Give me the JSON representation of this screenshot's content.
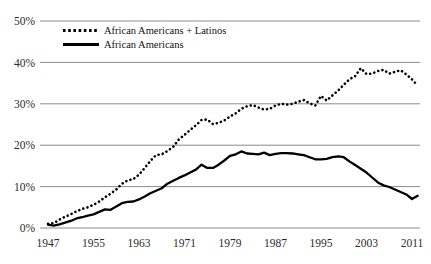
{
  "chart_data": {
    "type": "line",
    "title": "",
    "xlabel": "",
    "ylabel": "",
    "xlim": [
      1947,
      2012
    ],
    "ylim": [
      0,
      50
    ],
    "grid": true,
    "grid_axis": "y",
    "legend_position": "top-left-inside",
    "x_ticks": [
      "1947",
      "1955",
      "1963",
      "1971",
      "1979",
      "1987",
      "1995",
      "2003",
      "2011"
    ],
    "y_ticks": [
      "0%",
      "10%",
      "20%",
      "30%",
      "40%",
      "50%"
    ],
    "y_tick_values": [
      0,
      10,
      20,
      30,
      40,
      50
    ],
    "x_tick_values": [
      1947,
      1955,
      1963,
      1971,
      1979,
      1987,
      1995,
      2003,
      2011
    ],
    "x": [
      1947,
      1948,
      1949,
      1950,
      1951,
      1952,
      1953,
      1954,
      1955,
      1956,
      1957,
      1958,
      1959,
      1960,
      1961,
      1962,
      1963,
      1964,
      1965,
      1966,
      1967,
      1968,
      1969,
      1970,
      1971,
      1972,
      1973,
      1974,
      1975,
      1976,
      1977,
      1978,
      1979,
      1980,
      1981,
      1982,
      1983,
      1984,
      1985,
      1986,
      1987,
      1988,
      1989,
      1990,
      1991,
      1992,
      1993,
      1994,
      1995,
      1996,
      1997,
      1998,
      1999,
      2000,
      2001,
      2002,
      2003,
      2004,
      2005,
      2006,
      2007,
      2008,
      2009,
      2010,
      2011,
      2012
    ],
    "series": [
      {
        "name": "African Americans + Latinos",
        "style": "dotted",
        "color": "#000000",
        "values": [
          1.0,
          1.2,
          2.0,
          2.7,
          3.3,
          4.0,
          4.6,
          5.0,
          5.6,
          6.4,
          7.4,
          8.3,
          9.3,
          10.7,
          11.5,
          11.8,
          12.9,
          14.5,
          16.2,
          17.6,
          17.8,
          18.6,
          19.6,
          21.4,
          22.5,
          23.7,
          24.8,
          26.1,
          26.2,
          25.1,
          25.4,
          26.0,
          26.9,
          27.7,
          28.8,
          29.4,
          29.7,
          29.1,
          28.6,
          28.8,
          29.6,
          30.0,
          29.8,
          30.0,
          30.5,
          30.9,
          30.1,
          29.6,
          31.9,
          30.8,
          32.0,
          33.2,
          34.6,
          35.9,
          36.7,
          38.6,
          37.2,
          37.3,
          37.9,
          38.2,
          37.3,
          37.7,
          38.1,
          37.1,
          35.9,
          34.4
        ]
      },
      {
        "name": "African Americans",
        "style": "solid",
        "color": "#000000",
        "values": [
          0.8,
          0.6,
          0.9,
          1.3,
          1.7,
          2.3,
          2.6,
          3.0,
          3.3,
          3.9,
          4.5,
          4.4,
          5.2,
          6.0,
          6.3,
          6.4,
          6.9,
          7.6,
          8.4,
          9.0,
          9.6,
          10.7,
          11.4,
          12.1,
          12.7,
          13.4,
          14.1,
          15.3,
          14.5,
          14.5,
          15.3,
          16.3,
          17.4,
          17.8,
          18.5,
          18.0,
          17.9,
          17.8,
          18.2,
          17.6,
          17.9,
          18.1,
          18.1,
          18.0,
          17.8,
          17.6,
          17.1,
          16.6,
          16.6,
          16.7,
          17.1,
          17.3,
          17.1,
          16.1,
          15.2,
          14.3,
          13.4,
          12.2,
          11.0,
          10.3,
          9.9,
          9.3,
          8.7,
          8.1,
          7.0,
          7.8
        ]
      }
    ],
    "legend": [
      {
        "label": "African Americans + Latinos",
        "style": "dotted"
      },
      {
        "label": "African Americans",
        "style": "solid"
      }
    ],
    "values_end": {
      "dotted_last": 34.4,
      "solid_last": 7.2
    }
  }
}
